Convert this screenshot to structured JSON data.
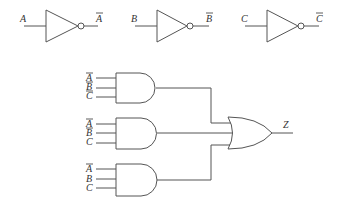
{
  "inverters": [
    {
      "input": "A",
      "output": "A",
      "output_negated": true
    },
    {
      "input": "B",
      "output": "B",
      "output_negated": true
    },
    {
      "input": "C",
      "output": "C",
      "output_negated": true
    }
  ],
  "and_gates": [
    {
      "inputs": [
        {
          "label": "A",
          "negated": true
        },
        {
          "label": "B",
          "negated": true
        },
        {
          "label": "C",
          "negated": true
        }
      ]
    },
    {
      "inputs": [
        {
          "label": "A",
          "negated": true
        },
        {
          "label": "B",
          "negated": true
        },
        {
          "label": "C",
          "negated": false
        }
      ]
    },
    {
      "inputs": [
        {
          "label": "A",
          "negated": true
        },
        {
          "label": "B",
          "negated": false
        },
        {
          "label": "C",
          "negated": false
        }
      ]
    }
  ],
  "or_gate": {
    "output": "Z"
  },
  "colors": {
    "line": "#555555",
    "text": "#333333",
    "background": "#ffffff"
  }
}
